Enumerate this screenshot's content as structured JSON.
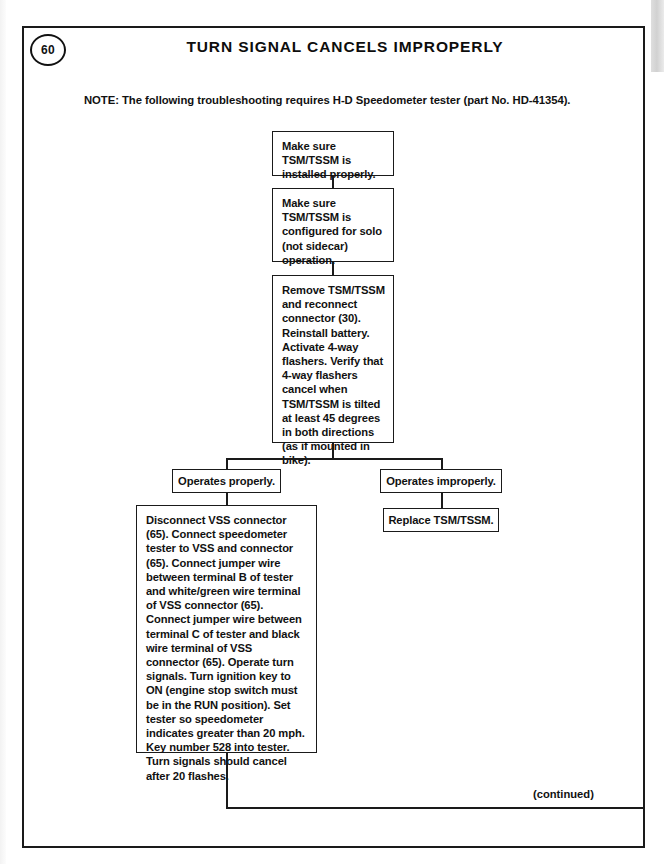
{
  "page": {
    "number": "60",
    "title": "TURN SIGNAL CANCELS IMPROPERLY",
    "note": "NOTE: The following troubleshooting requires H-D Speedometer tester (part No. HD-41354).",
    "footer": "(continued)"
  },
  "flow": {
    "step1": "Make sure TSM/TSSM is installed properly.",
    "step2": "Make sure TSM/TSSM is configured for solo (not sidecar) operation.",
    "step3": "Remove TSM/TSSM and reconnect connector (30). Reinstall battery. Activate 4-way flashers. Verify that 4-way flashers cancel when TSM/TSSM is tilted at least 45 degrees in both directions (as if mounted in bike).",
    "branch_left": "Operates properly.",
    "branch_right": "Operates improperly.",
    "right_action": "Replace TSM/TSSM.",
    "left_action": "Disconnect VSS connector (65). Connect speedometer tester to VSS and connector (65). Connect jumper wire between terminal B of tester and white/green wire terminal of VSS connector (65). Connect jumper wire between terminal C of tester and black wire terminal of VSS connector (65). Operate turn signals. Turn ignition key to ON (engine stop switch must be in the RUN position). Set tester so speedometer indicates greater than 20 mph. Key number 528 into tester. Turn signals should cancel after 20 flashes."
  },
  "colors": {
    "ink": "#1a1a1a",
    "paper": "#ffffff"
  }
}
